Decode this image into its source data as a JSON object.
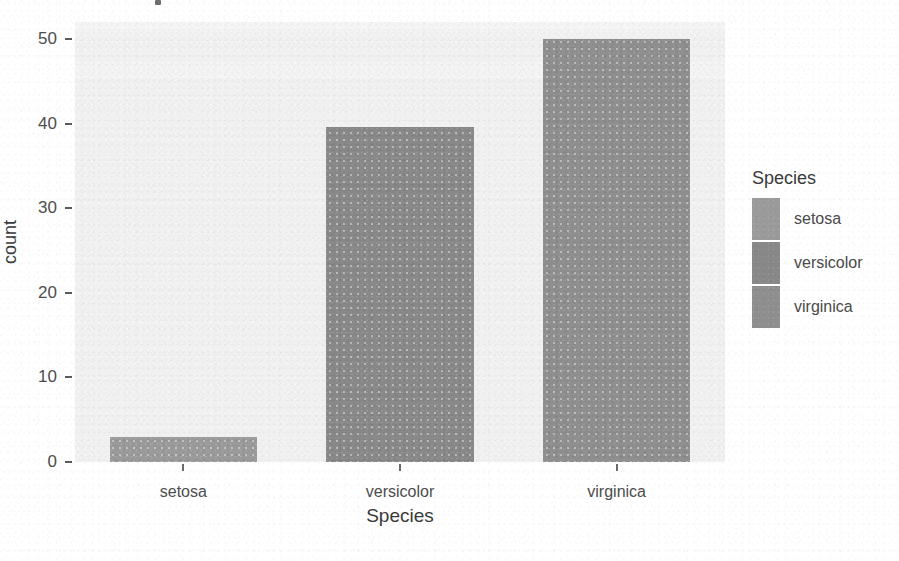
{
  "chart_data": {
    "type": "bar",
    "title": "",
    "subtitle": "",
    "xlabel": "Species",
    "ylabel": "count",
    "categories": [
      "setosa",
      "versicolor",
      "virginica"
    ],
    "values": [
      3,
      39.6,
      50
    ],
    "series": [
      {
        "name": "count",
        "values": [
          3,
          39.6,
          50
        ]
      }
    ],
    "ylim": [
      0,
      52
    ],
    "y_ticks": [
      0,
      10,
      20,
      30,
      40,
      50
    ],
    "y_tick_labels": [
      "0",
      "10",
      "20",
      "30",
      "40",
      "50"
    ],
    "x_tick_labels": [
      "setosa",
      "versicolor",
      "virginica"
    ],
    "grid": false,
    "legend_position": "right",
    "legend": {
      "title": "Species",
      "entries": [
        {
          "label": "setosa",
          "color": "#9b9b9b"
        },
        {
          "label": "versicolor",
          "color": "#898989"
        },
        {
          "label": "virginica",
          "color": "#8f8f8f"
        }
      ]
    },
    "bar_colors": [
      "#9b9b9b",
      "#898989",
      "#8f8f8f"
    ],
    "panel_background": "#f1f1f1",
    "figure_background": "#ffffff"
  },
  "axes": {
    "y_title": "count",
    "x_title": "Species",
    "y_ticks": [
      {
        "label": "50",
        "value": 50
      },
      {
        "label": "40",
        "value": 40
      },
      {
        "label": "30",
        "value": 30
      },
      {
        "label": "20",
        "value": 20
      },
      {
        "label": "10",
        "value": 10
      },
      {
        "label": "0",
        "value": 0
      }
    ],
    "x_ticks": [
      {
        "label": "setosa"
      },
      {
        "label": "versicolor"
      },
      {
        "label": "virginica"
      }
    ]
  },
  "legend": {
    "title": "Species",
    "items": [
      {
        "label": "setosa",
        "color": "#9b9b9b"
      },
      {
        "label": "versicolor",
        "color": "#898989"
      },
      {
        "label": "virginica",
        "color": "#8f8f8f"
      }
    ]
  }
}
